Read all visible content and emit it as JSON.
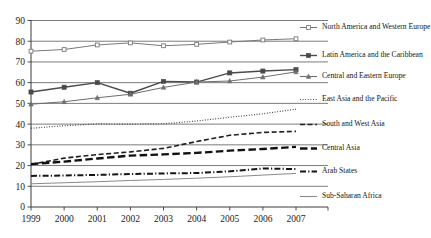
{
  "chart_data": {
    "type": "line",
    "title": "",
    "subtitle": "",
    "xlabel": "",
    "ylabel": "",
    "x": [
      1999,
      2000,
      2001,
      2002,
      2003,
      2004,
      2005,
      2006,
      2007
    ],
    "xticklabels": [
      "1999",
      "2000",
      "2001",
      "2002",
      "2003",
      "2004",
      "2005",
      "2006",
      "2007"
    ],
    "yticklabels": [
      "0",
      "10",
      "20",
      "30",
      "40",
      "50",
      "60",
      "70",
      "80",
      "90"
    ],
    "ylim": [
      0,
      90
    ],
    "ytick_step": 10,
    "grid": "horizontal",
    "legend_position": "right",
    "series": [
      {
        "name": "North America and Western Europe",
        "values": [
          75.2,
          76.0,
          78.2,
          79.2,
          77.8,
          78.5,
          79.6,
          80.6,
          81.2
        ],
        "marker": "square-open",
        "dash": "solid",
        "color": "#7a7a7a",
        "width": 1.0
      },
      {
        "name": "Latin America and the Caribbean",
        "values": [
          55.5,
          57.8,
          60.0,
          54.9,
          60.6,
          60.3,
          64.7,
          65.6,
          66.3
        ],
        "marker": "square-filled",
        "dash": "solid",
        "color": "#4a4a4a",
        "width": 1.4
      },
      {
        "name": "Central and Eastern Europe",
        "values": [
          49.6,
          50.8,
          52.7,
          54.4,
          57.7,
          60.3,
          60.8,
          62.7,
          65.2
        ],
        "marker": "triangle",
        "dash": "solid",
        "color": "#6e6e6e",
        "width": 1.0
      },
      {
        "name": "East Asia and the Pacific",
        "values": [
          38.0,
          39.2,
          40.1,
          40.0,
          40.2,
          41.5,
          43.3,
          45.0,
          47.2
        ],
        "marker": "none",
        "dash": "dotted",
        "color": "#3c3c3c",
        "width": 1.2
      },
      {
        "name": "South and West Asia",
        "values": [
          20.5,
          23.6,
          25.3,
          26.6,
          28.3,
          31.6,
          34.6,
          36.0,
          36.5
        ],
        "marker": "none",
        "dash": "dashed",
        "color": "#1f1f1f",
        "width": 1.6
      },
      {
        "name": "Central Asia",
        "values": [
          20.7,
          21.9,
          23.4,
          24.8,
          25.4,
          26.1,
          27.2,
          28.0,
          29.0
        ],
        "marker": "none",
        "dash": "long-dash",
        "color": "#101010",
        "width": 2.4
      },
      {
        "name": "Arab States",
        "values": [
          15.0,
          15.2,
          15.5,
          15.9,
          16.2,
          16.4,
          17.2,
          18.6,
          18.3
        ],
        "marker": "none",
        "dash": "dash-dot",
        "color": "#151515",
        "width": 2.0
      },
      {
        "name": "Sub-Saharan Africa",
        "values": [
          11.2,
          11.7,
          12.2,
          12.8,
          13.3,
          13.9,
          14.6,
          15.4,
          16.2
        ],
        "marker": "none",
        "dash": "solid",
        "color": "#8a8a8a",
        "width": 1.0
      }
    ]
  },
  "axis": {
    "tick_color": "#3a3a3a",
    "grid_color": "#5a5a5a"
  }
}
